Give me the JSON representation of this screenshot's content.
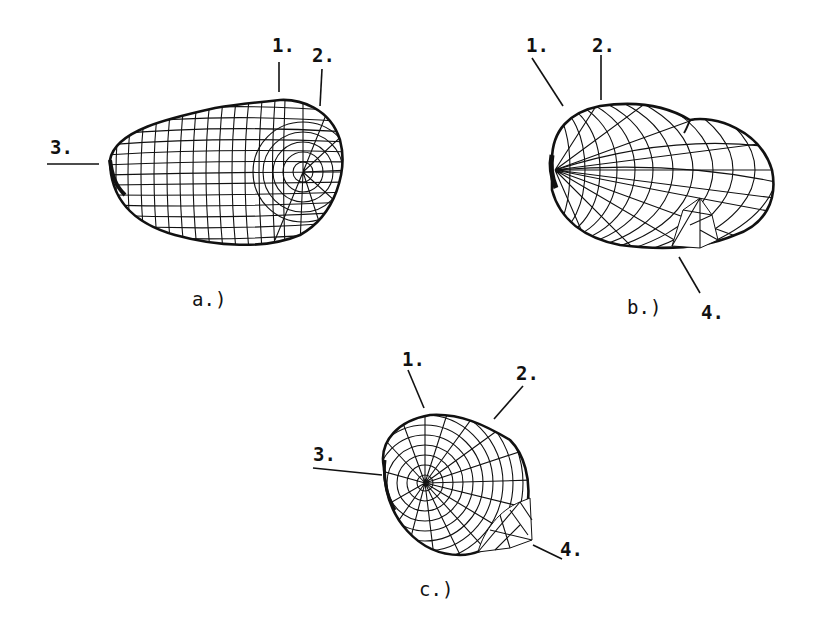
{
  "figure": {
    "panels": [
      {
        "id": "a",
        "caption": "a.)",
        "labels": [
          {
            "text": "1."
          },
          {
            "text": "2."
          },
          {
            "text": "3."
          }
        ]
      },
      {
        "id": "b",
        "caption": "b.)",
        "labels": [
          {
            "text": "1."
          },
          {
            "text": "2."
          },
          {
            "text": "4."
          }
        ]
      },
      {
        "id": "c",
        "caption": "c.)",
        "labels": [
          {
            "text": "1."
          },
          {
            "text": "2."
          },
          {
            "text": "3."
          },
          {
            "text": "4."
          }
        ]
      }
    ],
    "colors": {
      "ink": "#111111",
      "background": "#ffffff"
    }
  }
}
